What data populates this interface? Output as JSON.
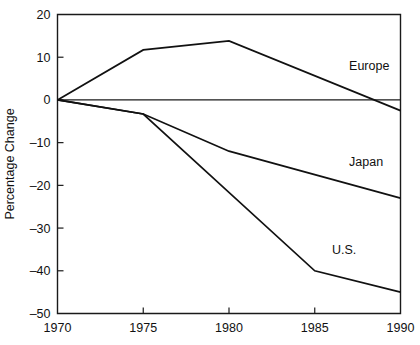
{
  "chart_data": {
    "type": "line",
    "title": "",
    "subtitle": "",
    "xlabel": "",
    "ylabel": "Percentage Change",
    "x": [
      1970,
      1975,
      1980,
      1985,
      1990
    ],
    "xlim": [
      1970,
      1990
    ],
    "ylim": [
      -50,
      20
    ],
    "xticks": [
      1970,
      1975,
      1980,
      1985,
      1990
    ],
    "xtick_labels": [
      "1970",
      "1975",
      "1980",
      "1985",
      "1990"
    ],
    "yticks": [
      20,
      10,
      0,
      -10,
      -20,
      -30,
      -40,
      -50
    ],
    "ytick_labels": [
      "20",
      "10",
      "0",
      "–10",
      "–20",
      "–30",
      "–40",
      "–50"
    ],
    "grid": false,
    "legend_position": "inline-annotations",
    "zero_reference_line": true,
    "series": [
      {
        "name": "Europe",
        "label": "Europe",
        "points": [
          {
            "x": 1970,
            "y": 0
          },
          {
            "x": 1975,
            "y": 11.7
          },
          {
            "x": 1980,
            "y": 13.8
          },
          {
            "x": 1990,
            "y": -2.5
          }
        ],
        "values": [
          0,
          11.7,
          13.8,
          null,
          -2.5
        ]
      },
      {
        "name": "Japan",
        "label": "Japan",
        "points": [
          {
            "x": 1970,
            "y": 0
          },
          {
            "x": 1975,
            "y": -3.3
          },
          {
            "x": 1980,
            "y": -12.0
          },
          {
            "x": 1990,
            "y": -23.0
          }
        ],
        "values": [
          0,
          -3.3,
          -12.0,
          null,
          -23.0
        ]
      },
      {
        "name": "U.S.",
        "label": "U.S.",
        "points": [
          {
            "x": 1970,
            "y": 0
          },
          {
            "x": 1975,
            "y": -3.3
          },
          {
            "x": 1985,
            "y": -40.0
          },
          {
            "x": 1990,
            "y": -45.0
          }
        ],
        "values": [
          0,
          -3.3,
          null,
          -40.0,
          -45.0
        ]
      }
    ],
    "annotations": [
      {
        "text": "Europe",
        "x": 1987.0,
        "y": 7.0,
        "series": "Europe"
      },
      {
        "text": "Japan",
        "x": 1987.0,
        "y": -15.5,
        "series": "Japan"
      },
      {
        "text": "U.S.",
        "x": 1986.0,
        "y": -36.0,
        "series": "U.S."
      }
    ]
  },
  "colors": {
    "line": "#111111",
    "axis": "#1a1a1a",
    "background": "#ffffff"
  }
}
